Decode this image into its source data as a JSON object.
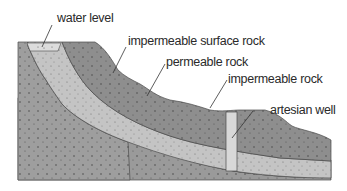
{
  "diagram": {
    "type": "cross-section",
    "labels": {
      "water_level": "water level",
      "impermeable_surface_rock": "impermeable surface rock",
      "permeable_rock": "permeable rock",
      "impermeable_rock": "impermeable rock",
      "artesian_well": "artesian well"
    },
    "colors": {
      "impermeable_surface_rock": "#8e8e8e",
      "permeable_rock": "#bdbdbd",
      "impermeable_rock": "#9a9a9a",
      "water": "#d9d9d9",
      "well": "#d6d6d6",
      "outline": "#4a4a4a",
      "leader": "#333333"
    }
  }
}
